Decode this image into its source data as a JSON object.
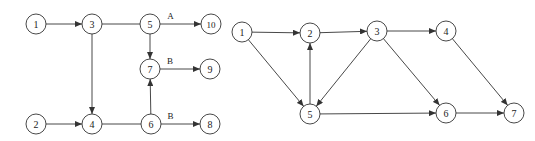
{
  "colors": {
    "stroke": "#333333",
    "background": "#ffffff",
    "text": "#222222"
  },
  "node_radius": 10,
  "diagrams": [
    {
      "id": "left",
      "nodes": [
        {
          "id": "1",
          "label": "1",
          "x": 36,
          "y": 24
        },
        {
          "id": "3",
          "label": "3",
          "x": 92,
          "y": 24
        },
        {
          "id": "5",
          "label": "5",
          "x": 150,
          "y": 24
        },
        {
          "id": "10",
          "label": "10",
          "x": 211,
          "y": 24
        },
        {
          "id": "7",
          "label": "7",
          "x": 150,
          "y": 69
        },
        {
          "id": "9",
          "label": "9",
          "x": 210,
          "y": 69
        },
        {
          "id": "2",
          "label": "2",
          "x": 36,
          "y": 124
        },
        {
          "id": "4",
          "label": "4",
          "x": 92,
          "y": 124
        },
        {
          "id": "6",
          "label": "6",
          "x": 151,
          "y": 124
        },
        {
          "id": "8",
          "label": "8",
          "x": 210,
          "y": 124
        }
      ],
      "edges": [
        {
          "from": "1",
          "to": "3",
          "arrow": true,
          "label": ""
        },
        {
          "from": "3",
          "to": "5",
          "arrow": false,
          "label": ""
        },
        {
          "from": "5",
          "to": "10",
          "arrow": true,
          "label": "A"
        },
        {
          "from": "5",
          "to": "7",
          "arrow": true,
          "label": ""
        },
        {
          "from": "3",
          "to": "4",
          "arrow": true,
          "label": ""
        },
        {
          "from": "2",
          "to": "4",
          "arrow": true,
          "label": ""
        },
        {
          "from": "4",
          "to": "6",
          "arrow": false,
          "label": ""
        },
        {
          "from": "6",
          "to": "7",
          "arrow": true,
          "label": ""
        },
        {
          "from": "7",
          "to": "9",
          "arrow": true,
          "label": "B"
        },
        {
          "from": "6",
          "to": "8",
          "arrow": true,
          "label": "B"
        }
      ]
    },
    {
      "id": "right",
      "nodes": [
        {
          "id": "1",
          "label": "1",
          "x": 242,
          "y": 32
        },
        {
          "id": "2",
          "label": "2",
          "x": 310,
          "y": 33
        },
        {
          "id": "3",
          "label": "3",
          "x": 377,
          "y": 31
        },
        {
          "id": "4",
          "label": "4",
          "x": 446,
          "y": 31
        },
        {
          "id": "5",
          "label": "5",
          "x": 310,
          "y": 114
        },
        {
          "id": "6",
          "label": "6",
          "x": 446,
          "y": 113
        },
        {
          "id": "7",
          "label": "7",
          "x": 514,
          "y": 113
        }
      ],
      "edges": [
        {
          "from": "1",
          "to": "2",
          "arrow": true,
          "label": ""
        },
        {
          "from": "1",
          "to": "5",
          "arrow": true,
          "label": ""
        },
        {
          "from": "2",
          "to": "3",
          "arrow": true,
          "label": ""
        },
        {
          "from": "5",
          "to": "2",
          "arrow": true,
          "label": ""
        },
        {
          "from": "3",
          "to": "5",
          "arrow": true,
          "label": ""
        },
        {
          "from": "3",
          "to": "4",
          "arrow": true,
          "label": ""
        },
        {
          "from": "3",
          "to": "6",
          "arrow": true,
          "label": ""
        },
        {
          "from": "5",
          "to": "6",
          "arrow": true,
          "label": ""
        },
        {
          "from": "4",
          "to": "7",
          "arrow": true,
          "label": ""
        },
        {
          "from": "6",
          "to": "7",
          "arrow": true,
          "label": ""
        }
      ]
    }
  ]
}
